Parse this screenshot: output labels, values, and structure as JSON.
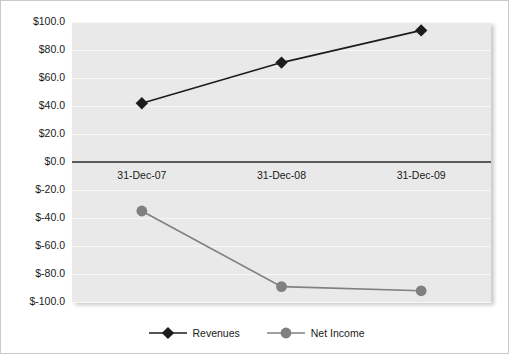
{
  "chart_data": {
    "type": "line",
    "title": "",
    "subtitle": "",
    "xlabel": "",
    "ylabel": "",
    "categories": [
      "31-Dec-07",
      "31-Dec-08",
      "31-Dec-09"
    ],
    "series": [
      {
        "name": "Revenues",
        "values": [
          42,
          71,
          94
        ],
        "color": "#1c1c1c",
        "marker": "diamond"
      },
      {
        "name": "Net Income",
        "values": [
          -35,
          -89,
          -92
        ],
        "color": "#808080",
        "marker": "circle"
      }
    ],
    "ylim": [
      -100,
      100
    ],
    "ytick_step": 20,
    "ytick_labels": [
      "$100.0",
      "$80.0",
      "$60.0",
      "$40.0",
      "$20.0",
      "$0.0",
      "$-20.0",
      "$-40.0",
      "$-60.0",
      "$-80.0",
      "$-100.0"
    ],
    "ytick_values": [
      100,
      80,
      60,
      40,
      20,
      0,
      -20,
      -40,
      -60,
      -80,
      -100
    ],
    "grid": true,
    "grid_color": "#f8f8f8",
    "plot_background": "#e9e9e9",
    "zero_axis_color": "#5a5a5a",
    "legend_position": "bottom"
  },
  "legend": {
    "items": [
      {
        "label": "Revenues",
        "icon": "diamond-marker-icon"
      },
      {
        "label": "Net Income",
        "icon": "circle-marker-icon"
      }
    ]
  }
}
